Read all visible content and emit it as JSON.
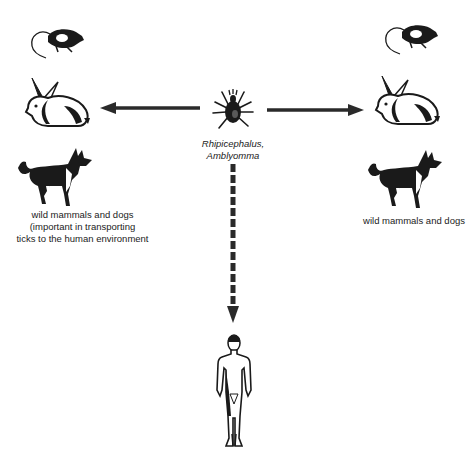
{
  "diagram": {
    "type": "transmission-cycle",
    "center": {
      "icon": "tick-icon",
      "label_line1": "Rhipicephalus,",
      "label_line2": "Amblyomma"
    },
    "left_group": {
      "icons": [
        "rat-icon",
        "rabbit-icon",
        "dog-icon"
      ],
      "label_line1": "wild mammals and dogs",
      "label_line2": "(important in transporting",
      "label_line3": "ticks to the human environment"
    },
    "right_group": {
      "icons": [
        "rat-icon",
        "rabbit-icon",
        "dog-icon"
      ],
      "label_line1": "wild mammals and dogs"
    },
    "bottom": {
      "icon": "human-figure-icon"
    },
    "arrows": [
      {
        "from": "tick",
        "to": "left_group",
        "style": "solid"
      },
      {
        "from": "tick",
        "to": "right_group",
        "style": "solid"
      },
      {
        "from": "tick",
        "to": "human",
        "style": "dashed"
      }
    ],
    "colors": {
      "ink": "#1a1a1a",
      "background": "#ffffff"
    }
  }
}
